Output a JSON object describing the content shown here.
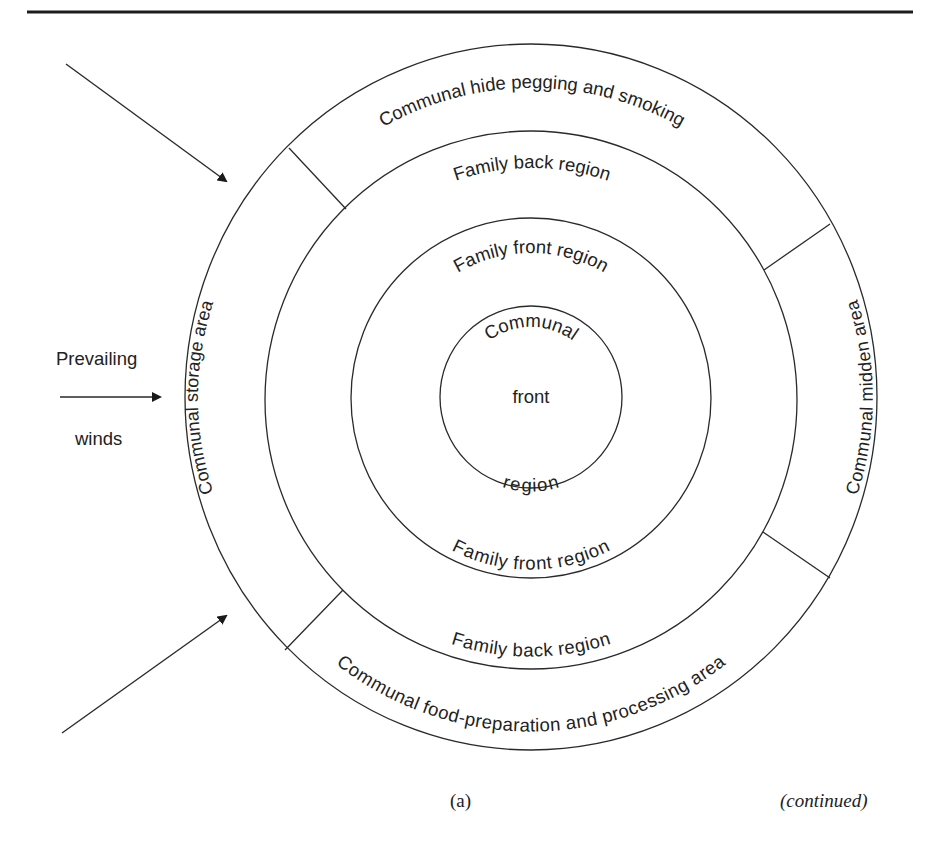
{
  "figure": {
    "rings": {
      "outer": {
        "top": "Communal hide pegging and smoking",
        "right": "Communal midden area",
        "bottom": "Communal food-preparation and processing area",
        "left": "Communal storage area"
      },
      "back": {
        "top": "Family back region",
        "bottom": "Family back region"
      },
      "front": {
        "top": "Family front region",
        "bottom": "Family front region"
      },
      "center": {
        "line1": "Communal",
        "line2": "front",
        "line3": "region"
      }
    },
    "wind": {
      "label_top": "Prevailing",
      "label_bottom": "winds"
    },
    "caption": {
      "panel": "(a)",
      "continued": "(continued)"
    }
  },
  "colors": {
    "stroke": "#2a2a2a",
    "text": "#222222",
    "background": "#ffffff"
  }
}
